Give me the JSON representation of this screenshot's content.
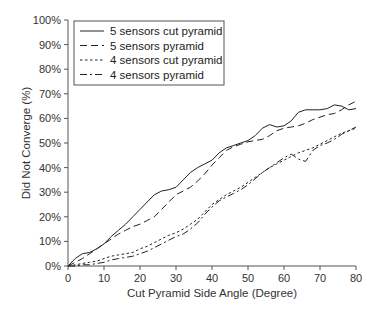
{
  "chart_data": {
    "type": "line",
    "title": "",
    "xlabel": "Cut Pyramid Side Angle (Degree)",
    "ylabel": "Did Not Converge (%)",
    "xlim": [
      0,
      80
    ],
    "ylim": [
      0,
      100
    ],
    "grid": false,
    "legend_position": "upper-left",
    "x_ticks": [
      0,
      10,
      20,
      30,
      40,
      50,
      60,
      70,
      80
    ],
    "y_ticks": [
      "0%",
      "10%",
      "20%",
      "30%",
      "40%",
      "50%",
      "60%",
      "70%",
      "80%",
      "90%",
      "100%"
    ],
    "x": [
      0,
      2,
      4,
      6,
      8,
      10,
      12,
      14,
      16,
      18,
      20,
      22,
      24,
      26,
      28,
      30,
      32,
      34,
      36,
      38,
      40,
      42,
      44,
      46,
      48,
      50,
      52,
      54,
      56,
      58,
      60,
      62,
      64,
      66,
      68,
      70,
      72,
      74,
      76,
      78,
      80
    ],
    "series": [
      {
        "name": "5 sensors cut pyramid",
        "style": "solid",
        "values": [
          0,
          3,
          5,
          5.5,
          7,
          9,
          12,
          14.5,
          17,
          20,
          23,
          26,
          29,
          30.5,
          31,
          32,
          35,
          38,
          40,
          41.5,
          43,
          46,
          48,
          49,
          50,
          51,
          53,
          56,
          57.5,
          56.5,
          57,
          59,
          62.5,
          63.5,
          63.5,
          63.5,
          64,
          65.5,
          65,
          63.5,
          64
        ]
      },
      {
        "name": "5 sensors pyramid",
        "style": "dashed",
        "values": [
          0,
          1.5,
          3,
          5,
          7,
          9,
          11,
          13,
          14.5,
          16,
          17,
          18.5,
          20,
          23,
          26,
          29,
          30.5,
          32,
          34.5,
          37.5,
          41,
          44,
          47,
          48.5,
          49.5,
          50.5,
          51,
          51.5,
          53,
          55,
          56,
          56.5,
          57,
          58,
          59.5,
          60.5,
          61.5,
          62,
          63.5,
          65.5,
          67
        ]
      },
      {
        "name": "4 sensors cut pyramid",
        "style": "dotted",
        "values": [
          0,
          0.5,
          1,
          1.5,
          2,
          3,
          4,
          4.5,
          5,
          5.5,
          7,
          8,
          9.5,
          11,
          12.5,
          13.5,
          15,
          17,
          19,
          22,
          25,
          27,
          29,
          30.5,
          32,
          34,
          36,
          38,
          40,
          41.5,
          43,
          44.5,
          46,
          47,
          48,
          49.5,
          51,
          52.5,
          54,
          55,
          56
        ]
      },
      {
        "name": "4 sensors pyramid",
        "style": "dash-dot",
        "values": [
          0,
          0,
          0.5,
          0.5,
          1,
          1.5,
          2.5,
          3,
          3.5,
          4,
          5,
          6,
          7.5,
          9,
          10.5,
          12,
          13,
          15,
          17.5,
          21,
          24,
          26.5,
          28,
          29.5,
          31,
          33,
          35.5,
          38,
          40,
          42,
          44,
          45.5,
          43.5,
          42.5,
          47,
          49,
          50,
          51.5,
          53.5,
          55,
          56.5
        ]
      }
    ]
  },
  "plot_geometry": {
    "left": 68,
    "right": 356,
    "top": 20,
    "bottom": 266
  }
}
